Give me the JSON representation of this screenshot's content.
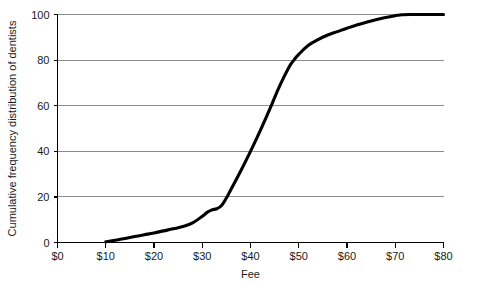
{
  "chart_data": {
    "type": "line",
    "title": "",
    "xlabel": "Fee",
    "ylabel": "Cumulative frequency distribution of dentists",
    "xlim": [
      0,
      80
    ],
    "ylim": [
      0,
      100
    ],
    "grid": true,
    "legend": "none",
    "x_tick_labels": [
      "$0",
      "$10",
      "$20",
      "$30",
      "$40",
      "$50",
      "$60",
      "$70",
      "$80"
    ],
    "x_tick_values": [
      0,
      10,
      20,
      30,
      40,
      50,
      60,
      70,
      80
    ],
    "y_tick_labels": [
      "0",
      "20",
      "40",
      "60",
      "80",
      "100"
    ],
    "y_tick_values": [
      0,
      20,
      40,
      60,
      80,
      100
    ],
    "series": [
      {
        "name": "Cumulative frequency distribution of dentists",
        "color": "#000000",
        "x": [
          10,
          12,
          14,
          16,
          18,
          20,
          22,
          24,
          26,
          28,
          30,
          31,
          32,
          33,
          34,
          35,
          36,
          38,
          40,
          42,
          44,
          46,
          48,
          49,
          50,
          52,
          54,
          56,
          58,
          60,
          62,
          64,
          66,
          68,
          70,
          71,
          73,
          80
        ],
        "y": [
          0.3,
          1.0,
          1.8,
          2.6,
          3.4,
          4.2,
          5.1,
          6.0,
          7.0,
          8.6,
          11.5,
          13.2,
          14.3,
          14.8,
          16.2,
          19.5,
          23.5,
          31.5,
          40.0,
          49.0,
          58.5,
          68.5,
          77.0,
          80.0,
          82.5,
          86.5,
          89.0,
          91.0,
          92.5,
          94.0,
          95.4,
          96.6,
          97.7,
          98.7,
          99.5,
          99.8,
          100.0,
          100.0
        ]
      }
    ],
    "annotations": []
  },
  "axis_titles": {
    "x": "Fee",
    "y": "Cumulative frequency distribution of dentists"
  }
}
